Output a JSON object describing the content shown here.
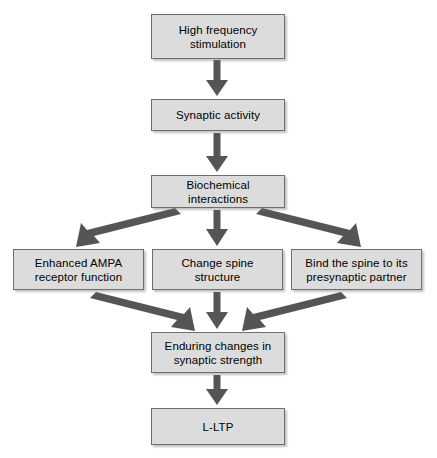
{
  "diagram": {
    "background_color": "#ffffff",
    "node_fill_color": "#dcdcdc",
    "node_border_color": "#6e6e6e",
    "arrow_color": "#555555",
    "text_color": "#000000",
    "nodes": [
      {
        "id": "high-frequency-stimulation",
        "label": "High frequency\nstimulation",
        "x": 151,
        "y": 14,
        "w": 134,
        "h": 45
      },
      {
        "id": "synaptic-activity",
        "label": "Synaptic activity",
        "x": 151,
        "y": 99,
        "w": 134,
        "h": 32
      },
      {
        "id": "biochemical-interactions",
        "label": "Biochemical interactions",
        "x": 151,
        "y": 175,
        "w": 134,
        "h": 33
      },
      {
        "id": "enhanced-ampa-receptor-function",
        "label": "Enhanced AMPA\nreceptor function",
        "x": 13,
        "y": 249,
        "w": 131,
        "h": 41
      },
      {
        "id": "change-spine-structure",
        "label": "Change spine\nstructure",
        "x": 152,
        "y": 249,
        "w": 131,
        "h": 41
      },
      {
        "id": "bind-the-spine-to-its-presynaptic-partner",
        "label": "Bind the spine to its\npresynaptic partner",
        "x": 291,
        "y": 249,
        "w": 131,
        "h": 41
      },
      {
        "id": "enduring-changes-in-synaptic-strength",
        "label": "Enduring changes in\nsynaptic strength",
        "x": 151,
        "y": 332,
        "w": 134,
        "h": 41
      },
      {
        "id": "l-ltp",
        "label": "L-LTP",
        "x": 151,
        "y": 408,
        "w": 134,
        "h": 37
      }
    ],
    "edges": [
      {
        "id": "edge-stimulation-to-activity",
        "from": "high-frequency-stimulation",
        "to": "synaptic-activity",
        "kind": "vertical"
      },
      {
        "id": "edge-activity-to-biochemical",
        "from": "synaptic-activity",
        "to": "biochemical-interactions",
        "kind": "vertical"
      },
      {
        "id": "edge-biochemical-to-ampa",
        "from": "biochemical-interactions",
        "to": "enhanced-ampa-receptor-function",
        "kind": "diagonal-left"
      },
      {
        "id": "edge-biochemical-to-spine",
        "from": "biochemical-interactions",
        "to": "change-spine-structure",
        "kind": "vertical"
      },
      {
        "id": "edge-biochemical-to-bind",
        "from": "biochemical-interactions",
        "to": "bind-the-spine-to-its-presynaptic-partner",
        "kind": "diagonal-right"
      },
      {
        "id": "edge-ampa-to-enduring",
        "from": "enhanced-ampa-receptor-function",
        "to": "enduring-changes-in-synaptic-strength",
        "kind": "diagonal-right"
      },
      {
        "id": "edge-spine-to-enduring",
        "from": "change-spine-structure",
        "to": "enduring-changes-in-synaptic-strength",
        "kind": "vertical"
      },
      {
        "id": "edge-bind-to-enduring",
        "from": "bind-the-spine-to-its-presynaptic-partner",
        "to": "enduring-changes-in-synaptic-strength",
        "kind": "diagonal-left"
      },
      {
        "id": "edge-enduring-to-lltp",
        "from": "enduring-changes-in-synaptic-strength",
        "to": "l-ltp",
        "kind": "vertical"
      }
    ]
  }
}
